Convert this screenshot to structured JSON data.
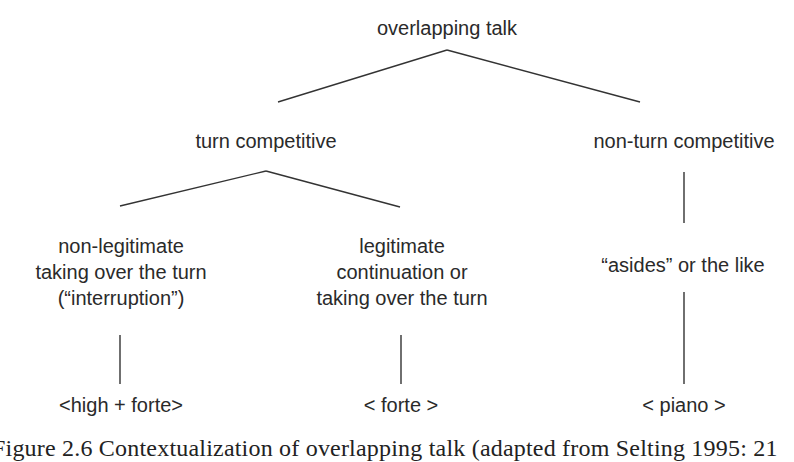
{
  "diagram": {
    "root": {
      "label": "overlapping talk"
    },
    "branches": [
      {
        "label": "turn competitive",
        "children": [
          {
            "lines": [
              "non-legitimate",
              "taking over the turn",
              "(“interruption”)"
            ],
            "prosody": "<high + forte>"
          },
          {
            "lines": [
              "legitimate",
              "continuation or",
              "taking over the turn"
            ],
            "prosody": "< forte >"
          }
        ]
      },
      {
        "label": "non-turn competitive",
        "children": [
          {
            "lines": [
              "“asides” or the like"
            ],
            "prosody": "< piano >"
          }
        ]
      }
    ],
    "caption": "Figure 2.6  Contextualization of overlapping talk (adapted from Selting 1995: 21"
  },
  "colors": {
    "line": "#333333",
    "text": "#2a2a2a",
    "background": "#ffffff"
  }
}
